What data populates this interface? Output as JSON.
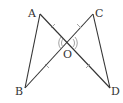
{
  "diagram": {
    "type": "geometry",
    "colors": {
      "line": "#333333",
      "marks": "#888888",
      "background": "#ffffff"
    },
    "points": {
      "A": {
        "label": "A",
        "x": 40,
        "y": 14
      },
      "B": {
        "label": "B",
        "x": 25,
        "y": 88
      },
      "C": {
        "label": "C",
        "x": 93,
        "y": 14
      },
      "D": {
        "label": "D",
        "x": 110,
        "y": 88
      },
      "O": {
        "label": "O",
        "x": 68,
        "y": 43
      }
    },
    "segments": [
      "AB",
      "AD",
      "CB",
      "CD"
    ],
    "equal_marks": [
      "AO",
      "CO",
      "BO",
      "DO"
    ],
    "angle_marks": [
      "AOB",
      "COD"
    ]
  }
}
